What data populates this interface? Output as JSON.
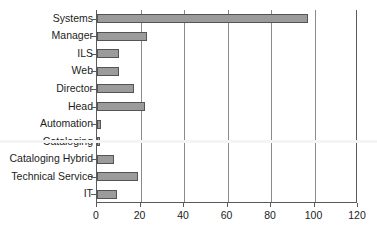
{
  "chart_data": {
    "type": "bar",
    "orientation": "horizontal",
    "title": "",
    "subtitle": "",
    "xlabel": "",
    "ylabel": "",
    "xlim": [
      0,
      120
    ],
    "ylim": null,
    "grid": true,
    "legend": null,
    "legend_position": "none",
    "xticks": [
      0,
      20,
      40,
      60,
      80,
      100,
      120
    ],
    "xtick_labels": [
      "0",
      "20",
      "40",
      "60",
      "80",
      "100",
      "120"
    ],
    "categories": [
      "Systems",
      "Manager",
      "ILS",
      "Web",
      "Director",
      "Head",
      "Automation",
      "Cataloging",
      "Cataloging Hybrid",
      "Technical Service",
      "IT"
    ],
    "values": [
      97,
      23,
      10,
      10,
      17,
      22,
      2,
      1,
      8,
      19,
      9
    ],
    "series": [
      {
        "name": "",
        "values": [
          97,
          23,
          10,
          10,
          17,
          22,
          2,
          1,
          8,
          19,
          9
        ]
      }
    ],
    "colors": {
      "bar_fill": "#9b9b9b",
      "bar_border": "#545454",
      "axis": "#5a5a5a",
      "gridline": "#8a8a8a",
      "text": "#1c1c1c",
      "background": "#ffffff"
    }
  }
}
